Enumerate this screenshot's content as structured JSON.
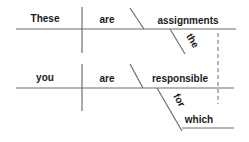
{
  "diagram": {
    "type": "sentence-diagram",
    "clauses": [
      {
        "id": "main",
        "subject": "These",
        "verb": "are",
        "complement": "assignments",
        "modifiers": [
          {
            "word": "the",
            "modifies": "assignments"
          }
        ]
      },
      {
        "id": "relative",
        "subject": "you",
        "verb": "are",
        "complement": "responsible",
        "modifiers": [
          {
            "word": "for",
            "modifies": "responsible",
            "object": "which"
          }
        ]
      }
    ],
    "connector": {
      "style": "dashed",
      "from": "assignments",
      "to": "which"
    }
  },
  "words": {
    "these": "These",
    "are1": "are",
    "assignments": "assignments",
    "the": "the",
    "you": "you",
    "are2": "are",
    "responsible": "responsible",
    "for": "for",
    "which": "which"
  },
  "colors": {
    "line": "#6e6e6e",
    "text": "#1a1a1a",
    "background": "#ffffff"
  }
}
